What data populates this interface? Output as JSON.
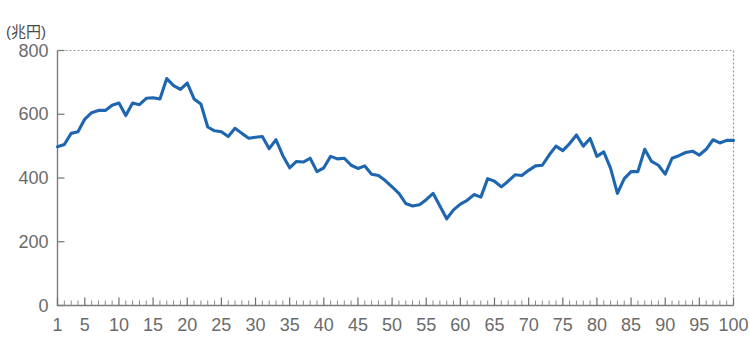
{
  "chart_data": {
    "type": "line",
    "title": "",
    "subtitle": "",
    "unit_label": "(兆円)",
    "xlabel": "",
    "ylabel": "",
    "xlim": [
      1,
      100
    ],
    "ylim": [
      0,
      800
    ],
    "y_ticks": [
      0,
      200,
      400,
      600,
      800
    ],
    "y_tick_labels": [
      "0",
      "200",
      "400",
      "600",
      "800"
    ],
    "x_ticks": [
      1,
      5,
      10,
      15,
      20,
      25,
      30,
      35,
      40,
      45,
      50,
      55,
      60,
      65,
      70,
      75,
      80,
      85,
      90,
      95,
      100
    ],
    "x_tick_labels": [
      "1",
      "5",
      "10",
      "15",
      "20",
      "25",
      "30",
      "35",
      "40",
      "45",
      "50",
      "55",
      "60",
      "65",
      "70",
      "75",
      "80",
      "85",
      "90",
      "95",
      "100"
    ],
    "x_minor_tick_interval": 1,
    "grid": false,
    "frame": "dotted-top-right",
    "legend": null,
    "legend_position": "none",
    "series": [
      {
        "name": "series-1",
        "color": "#1F66B0",
        "x": [
          1,
          2,
          3,
          4,
          5,
          6,
          7,
          8,
          9,
          10,
          11,
          12,
          13,
          14,
          15,
          16,
          17,
          18,
          19,
          20,
          21,
          22,
          23,
          24,
          25,
          26,
          27,
          28,
          29,
          30,
          31,
          32,
          33,
          34,
          35,
          36,
          37,
          38,
          39,
          40,
          41,
          42,
          43,
          44,
          45,
          46,
          47,
          48,
          49,
          50,
          51,
          52,
          53,
          54,
          55,
          56,
          57,
          58,
          59,
          60,
          61,
          62,
          63,
          64,
          65,
          66,
          67,
          68,
          69,
          70,
          71,
          72,
          73,
          74,
          75,
          76,
          77,
          78,
          79,
          80,
          81,
          82,
          83,
          84,
          85,
          86,
          87,
          88,
          89,
          90,
          91,
          92,
          93,
          94,
          95,
          96,
          97,
          98,
          99,
          100
        ],
        "values": [
          498,
          505,
          540,
          545,
          585,
          605,
          612,
          612,
          628,
          635,
          596,
          635,
          630,
          650,
          652,
          648,
          712,
          690,
          678,
          698,
          648,
          632,
          560,
          548,
          545,
          530,
          556,
          540,
          525,
          528,
          530,
          492,
          520,
          470,
          432,
          452,
          450,
          462,
          420,
          432,
          468,
          460,
          462,
          440,
          430,
          438,
          412,
          408,
          392,
          372,
          352,
          320,
          312,
          316,
          332,
          352,
          312,
          272,
          300,
          318,
          330,
          348,
          340,
          398,
          390,
          372,
          390,
          410,
          408,
          424,
          438,
          440,
          472,
          500,
          486,
          508,
          535,
          500,
          524,
          468,
          482,
          430,
          352,
          398,
          420,
          420,
          490,
          452,
          440,
          412,
          462,
          470,
          480,
          484,
          472,
          490,
          520,
          510,
          518,
          518
        ]
      }
    ]
  }
}
